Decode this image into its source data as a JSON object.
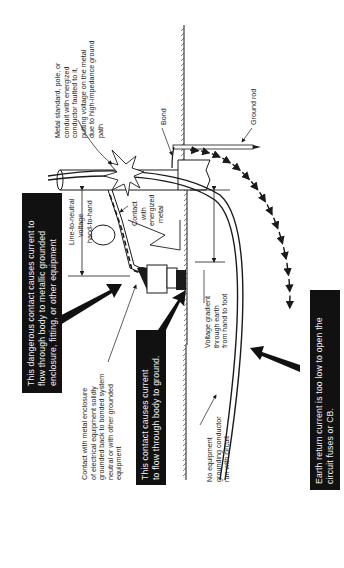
{
  "diagram": {
    "orientation": "rotated-90-ccw",
    "callouts": {
      "metal_standard": [
        "Metal standard, pole, or",
        "conduit with energized",
        "conductor faulted to it,",
        "putting voltage on the metal",
        "due to high-impedance ground",
        "path"
      ],
      "bond": "Bond",
      "ground_rod": "Ground rod",
      "line_to_neutral": [
        "Line-to-neutral",
        "voltage"
      ],
      "hand_to_hand": "hand-to-hand",
      "contact_energized": [
        "Contact",
        "with",
        "energized",
        "metal"
      ],
      "contact_enclosure": [
        "Contact with metal enclosure",
        "of electrical equipment solidly",
        "grounded back to bonded system",
        "neutral or with other grounded",
        "equipment"
      ],
      "voltage_gradient": [
        "Voltage gradient",
        "through earth",
        "from hand to foot"
      ],
      "no_egc": [
        "No equipment",
        "grounding conductor",
        "run with circuit"
      ]
    },
    "boxes": {
      "dangerous_contact": [
        "This dangerous contact causes current to",
        "flow through body to metallic grounded",
        "enclosure, fitting, or other equipment"
      ],
      "contact_ground": [
        "This contact causes current",
        "to flow through body to ground."
      ],
      "earth_return": [
        "Earth return current is too low to open the",
        "circuit fuses or CB."
      ]
    },
    "colors": {
      "ink": "#1a1a1a",
      "box_fill": "#111111",
      "box_text": "#f2f2f2",
      "background": "#ffffff"
    }
  }
}
